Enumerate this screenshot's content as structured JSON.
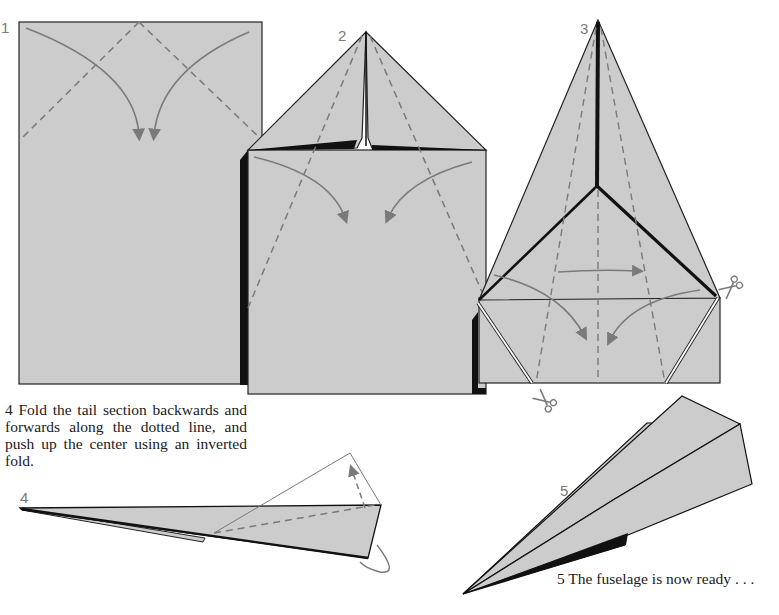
{
  "diagram": {
    "colors": {
      "paper": "#cccccc",
      "outline": "#111111",
      "fold_line": "#7a7a7a",
      "arrow": "#7a7a7a",
      "background": "#ffffff"
    },
    "steps": [
      {
        "number": "1",
        "description": "Rectangle sheet with two diagonal dashed fold lines from top center; curved arrows fold top corners inward"
      },
      {
        "number": "2",
        "description": "Top corners folded to center point; diagonal dashed lines show next fold; curved arrows fold sides inward"
      },
      {
        "number": "3",
        "description": "Kite shape with center crease; dashed lines, horizontal arrow and curved arrows; scissors mark cut lines at the bottom corners"
      },
      {
        "number": "4",
        "description": "Side view of folded fuselage with dashed tail fold line and curved arrow for inverted fold"
      },
      {
        "number": "5",
        "description": "Finished fuselage in perspective view"
      }
    ],
    "captions": {
      "step4": "4  Fold the tail section backwards and forwards along the dotted line, and push up the center using an inverted fold.",
      "step5": "5   The fuselage is now ready . . ."
    },
    "icons": [
      "scissors-icon",
      "scissors-icon",
      "scissors-icon"
    ]
  }
}
